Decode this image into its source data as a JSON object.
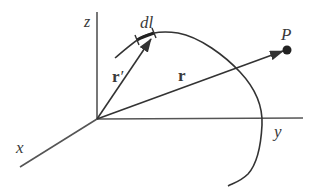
{
  "diagram": {
    "type": "vector-position-diagram",
    "colors": {
      "line": "#333333",
      "axis": "#555555",
      "label": "#3a3a3a",
      "background": "#ffffff"
    },
    "axes": {
      "z_label": "z",
      "y_label": "y",
      "x_label": "x"
    },
    "vectors": {
      "source_position_label": "r",
      "source_position_prime": "′",
      "field_position_label": "r"
    },
    "element_label": "dl",
    "point_label": "P"
  }
}
